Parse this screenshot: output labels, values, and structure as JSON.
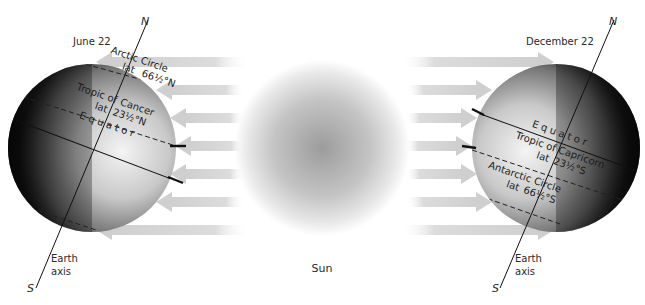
{
  "diagram": {
    "left_panel": {
      "date_label": "June 22",
      "axis_north": "N",
      "axis_south": "S",
      "axis_label_line1": "Earth",
      "axis_label_line2": "axis",
      "arctic_line1": "Arctic Circle",
      "arctic_line2_a": "lat",
      "arctic_line2_b": "66½°N",
      "tropic_line1_a": "Tropic of",
      "tropic_line1_b": "Cancer",
      "tropic_line2_a": "lat",
      "tropic_line2_b": "23½°N",
      "equator": "Equator"
    },
    "sun": {
      "label": "Sun"
    },
    "right_panel": {
      "date_label": "December 22",
      "axis_north": "N",
      "axis_south": "S",
      "axis_label_line1": "Earth",
      "axis_label_line2": "axis",
      "equator": "Equator",
      "tropic_line1_a": "Tropic of",
      "tropic_line1_b": "Capricorn",
      "tropic_line2_a": "lat",
      "tropic_line2_b": "23½°S",
      "antarctic_line1": "Antarctic Circle",
      "antarctic_line2_a": "lat",
      "antarctic_line2_b": "66½°S"
    },
    "colors": {
      "arrow": "#d6d6d6",
      "globe_dark": "#1c1c1c",
      "globe_light": "#f2f2f2",
      "sun_center": "#9a9a9a",
      "line": "#111111"
    }
  }
}
